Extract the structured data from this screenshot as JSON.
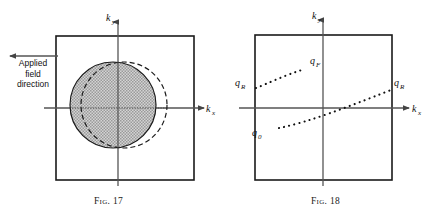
{
  "figures": [
    {
      "id": "fig17",
      "caption_prefix": "Fig.",
      "caption_number": "17",
      "axis_x_label": "k",
      "axis_x_sub": "x",
      "axis_y_label": "k",
      "axis_y_sub": "y",
      "annotation": "Applied\nfield\ndirection",
      "arrow_direction": "left",
      "shapes": {
        "box": {
          "x": 56,
          "y": 36,
          "width": 138,
          "height": 144
        },
        "origin": {
          "x": 118,
          "y": 108
        },
        "shaded_circle": {
          "cx": 113,
          "cy": 105,
          "r": 43,
          "fill": "#c9c9c9",
          "stroke": "#1a1a1a"
        },
        "dashed_circle": {
          "cx": 124,
          "cy": 105,
          "r": 43,
          "stroke": "#1a1a1a",
          "dash": "5 3"
        }
      }
    },
    {
      "id": "fig18",
      "caption_prefix": "Fig.",
      "caption_number": "18",
      "axis_x_label": "k",
      "axis_x_sub": "x",
      "axis_y_label": "k",
      "axis_y_sub": "y",
      "shapes": {
        "box": {
          "x": 38,
          "y": 35,
          "width": 137,
          "height": 145
        },
        "origin": {
          "x": 106,
          "y": 108
        }
      },
      "curve_labels": [
        {
          "name": "q-r-left",
          "symbol": "q",
          "sub": "R",
          "x": 18,
          "y": 82
        },
        {
          "name": "q-f",
          "symbol": "q",
          "sub": "F",
          "x": 93,
          "y": 60
        },
        {
          "name": "q-0",
          "symbol": "q",
          "sub": "0",
          "x": 35,
          "y": 132
        },
        {
          "name": "q-r-right",
          "symbol": "q",
          "sub": "R",
          "x": 177,
          "y": 82
        }
      ]
    }
  ],
  "colors": {
    "ink": "#1a1a1a",
    "axis": "#555555",
    "shade": "#c9c9c9",
    "dot": "#111111"
  }
}
